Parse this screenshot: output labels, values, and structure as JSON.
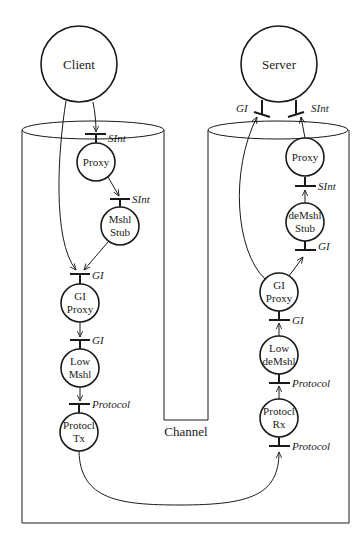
{
  "diagram": {
    "actors": {
      "client": "Client",
      "server": "Server"
    },
    "channel_label": "Channel",
    "client_side": {
      "nodes": [
        {
          "id": "proxy",
          "line1": "Proxy",
          "line2": ""
        },
        {
          "id": "mshl-stub",
          "line1": "Mshl",
          "line2": "Stub"
        },
        {
          "id": "gi-proxy",
          "line1": "GI",
          "line2": "Proxy"
        },
        {
          "id": "low-mshl",
          "line1": "Low",
          "line2": "Mshl"
        },
        {
          "id": "protocl-tx",
          "line1": "Protocl",
          "line2": "Tx"
        }
      ],
      "interfaces": [
        "SInt",
        "SInt",
        "GI",
        "GI",
        "Protocol"
      ]
    },
    "server_side": {
      "nodes": [
        {
          "id": "proxy",
          "line1": "Proxy",
          "line2": ""
        },
        {
          "id": "demshl-stub",
          "line1": "deMshl",
          "line2": "Stub"
        },
        {
          "id": "gi-proxy",
          "line1": "GI",
          "line2": "Proxy"
        },
        {
          "id": "low-demshl",
          "line1": "Low",
          "line2": "deMshl"
        },
        {
          "id": "protocl-rx",
          "line1": "Protocl",
          "line2": "Rx"
        }
      ],
      "interfaces": [
        "GI",
        "SInt",
        "SInt",
        "GI",
        "GI",
        "Protocol",
        "Protocol"
      ]
    }
  }
}
